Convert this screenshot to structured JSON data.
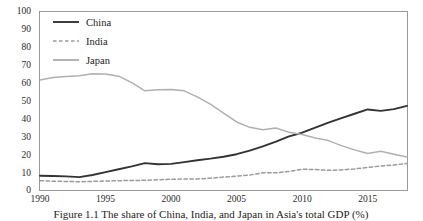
{
  "figure": {
    "caption": "Figure 1.1  The share of China, India, and Japan in Asia's total GDP (%)"
  },
  "chart_data": {
    "type": "line",
    "title": "",
    "xlabel": "",
    "ylabel": "",
    "xlim": [
      1990,
      2018
    ],
    "ylim": [
      0,
      100
    ],
    "ytick_labels": [
      "100",
      "90",
      "80",
      "70",
      "60",
      "50",
      "40",
      "30",
      "20",
      "10",
      "0"
    ],
    "ytick_values": [
      100,
      90,
      80,
      70,
      60,
      50,
      40,
      30,
      20,
      10,
      0
    ],
    "xtick_labels": [
      "1990",
      "1995",
      "2000",
      "2005",
      "2010",
      "2015"
    ],
    "xtick_values": [
      1990,
      1995,
      2000,
      2005,
      2010,
      2015
    ],
    "grid": false,
    "legend_position": "top-left",
    "x": [
      1990,
      1991,
      1992,
      1993,
      1994,
      1995,
      1996,
      1997,
      1998,
      1999,
      2000,
      2001,
      2002,
      2003,
      2004,
      2005,
      2006,
      2007,
      2008,
      2009,
      2010,
      2011,
      2012,
      2013,
      2014,
      2015,
      2016,
      2017,
      2018
    ],
    "series": [
      {
        "name": "China",
        "color": "#333333",
        "style": "solid",
        "width": 1.9,
        "values": [
          8.0,
          7.8,
          7.6,
          7.2,
          8.4,
          10.0,
          11.6,
          13.2,
          15.0,
          14.4,
          14.6,
          15.6,
          16.6,
          17.5,
          18.6,
          20.0,
          22.0,
          24.4,
          27.0,
          30.0,
          32.0,
          34.8,
          37.6,
          40.2,
          42.6,
          45.0,
          44.2,
          45.2,
          47.0
        ]
      },
      {
        "name": "India",
        "color": "#9b9b9b",
        "style": "dashed",
        "width": 1.5,
        "values": [
          5.2,
          4.9,
          4.8,
          4.6,
          4.8,
          5.0,
          5.2,
          5.3,
          5.4,
          5.7,
          6.0,
          6.1,
          6.2,
          6.6,
          7.2,
          7.8,
          8.4,
          9.6,
          9.6,
          10.4,
          11.6,
          11.4,
          11.0,
          11.2,
          11.8,
          12.6,
          13.4,
          14.0,
          14.8
        ]
      },
      {
        "name": "Japan",
        "color": "#b0b0b0",
        "style": "solid",
        "width": 1.5,
        "values": [
          61.5,
          62.8,
          63.4,
          63.8,
          65.0,
          64.8,
          63.6,
          60.0,
          55.4,
          56.0,
          56.2,
          55.4,
          52.0,
          48.0,
          43.0,
          38.0,
          35.0,
          33.6,
          34.6,
          32.2,
          31.0,
          29.0,
          27.6,
          24.8,
          22.4,
          20.4,
          21.6,
          20.0,
          18.4
        ]
      }
    ],
    "legend": [
      {
        "label": "China",
        "color": "#333333",
        "style": "solid"
      },
      {
        "label": "India",
        "color": "#9b9b9b",
        "style": "dashed"
      },
      {
        "label": "Japan",
        "color": "#b0b0b0",
        "style": "solid"
      }
    ]
  }
}
